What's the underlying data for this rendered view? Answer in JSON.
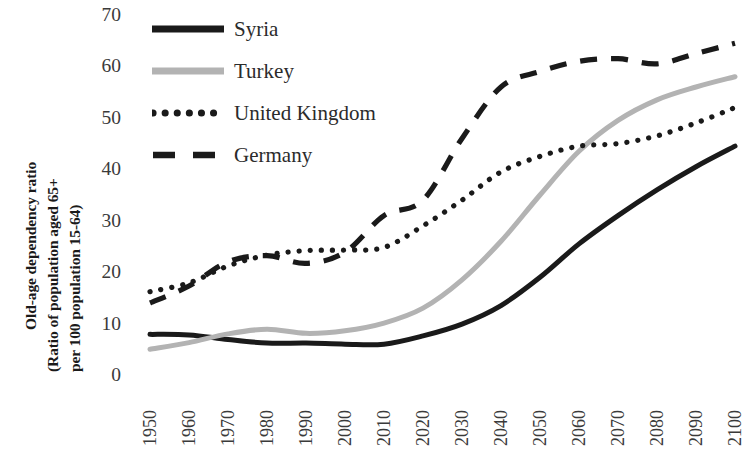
{
  "axes": {
    "ylabel_lines": [
      "Old-age dependency ratio",
      "(Ratio of population aged 65+",
      "per 100 population 15-64)"
    ],
    "yticks": [
      "0",
      "10",
      "20",
      "30",
      "40",
      "50",
      "60",
      "70"
    ],
    "xticks": [
      "1950",
      "1960",
      "1970",
      "1980",
      "1990",
      "2000",
      "2010",
      "2020",
      "2030",
      "2040",
      "2050",
      "2060",
      "2070",
      "2080",
      "2090",
      "2100"
    ]
  },
  "legend": {
    "items": [
      {
        "label": "Syria",
        "style": "solid",
        "color": "#1a1a1a"
      },
      {
        "label": "Turkey",
        "style": "solid",
        "color": "#b3b3b3"
      },
      {
        "label": "United Kingdom",
        "style": "dotted",
        "color": "#1a1a1a"
      },
      {
        "label": "Germany",
        "style": "dashed",
        "color": "#1a1a1a"
      }
    ]
  },
  "chart_data": {
    "type": "line",
    "title": "",
    "xlabel": "",
    "ylabel": "Old-age dependency ratio (Ratio of population aged 65+ per 100 population 15-64)",
    "x": [
      1950,
      1960,
      1970,
      1980,
      1990,
      2000,
      2010,
      2020,
      2030,
      2040,
      2050,
      2060,
      2070,
      2080,
      2090,
      2100
    ],
    "xlim": [
      1950,
      2100
    ],
    "ylim": [
      0,
      70
    ],
    "yticks": [
      0,
      10,
      20,
      30,
      40,
      50,
      60,
      70
    ],
    "grid": false,
    "legend_position": "upper-left-inside",
    "series": [
      {
        "name": "Syria",
        "color": "#1a1a1a",
        "style": "solid",
        "values": [
          7.9,
          7.8,
          6.9,
          6.2,
          6.2,
          6.0,
          6.0,
          7.6,
          9.9,
          13.5,
          19.0,
          25.5,
          31.0,
          36.0,
          40.5,
          44.5
        ]
      },
      {
        "name": "Turkey",
        "color": "#b3b3b3",
        "style": "solid",
        "values": [
          5.0,
          6.3,
          8.0,
          8.9,
          8.1,
          8.6,
          10.1,
          13.0,
          18.5,
          26.0,
          35.0,
          43.5,
          49.5,
          53.5,
          56.0,
          58.0
        ]
      },
      {
        "name": "United Kingdom",
        "color": "#1a1a1a",
        "style": "dotted",
        "values": [
          16.2,
          17.9,
          21.2,
          23.3,
          24.2,
          24.3,
          24.8,
          29.0,
          34.0,
          39.5,
          42.5,
          44.5,
          45.0,
          46.5,
          49.0,
          52.0
        ]
      },
      {
        "name": "Germany",
        "color": "#1a1a1a",
        "style": "dashed",
        "values": [
          14.0,
          17.3,
          22.0,
          23.2,
          21.7,
          23.9,
          31.0,
          34.0,
          46.0,
          56.0,
          59.0,
          61.0,
          61.5,
          60.5,
          62.5,
          64.5
        ]
      }
    ]
  }
}
